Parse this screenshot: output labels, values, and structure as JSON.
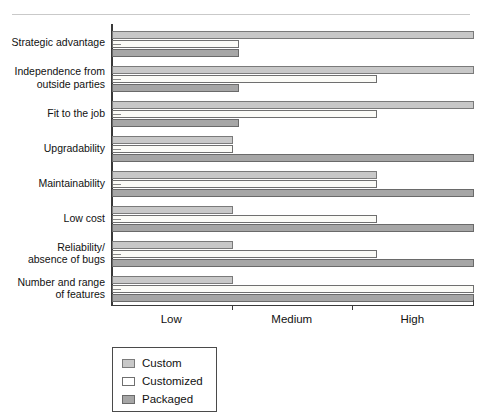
{
  "chart_data": {
    "type": "bar",
    "orientation": "horizontal",
    "title": "",
    "xlabel": "",
    "ylabel": "",
    "grid": false,
    "legend_position": "below-left",
    "axis_ticks": [
      "Low",
      "Medium",
      "High"
    ],
    "axis_scale": "ordinal",
    "axis_range": [
      0,
      3
    ],
    "categories": [
      "Strategic advantage",
      "Independence from\noutside parties",
      "Fit to the job",
      "Upgradability",
      "Maintainability",
      "Low cost",
      "Reliability/\nabsence of bugs",
      "Number and range\nof features"
    ],
    "series": [
      {
        "name": "Custom",
        "color": "#c8c8c8",
        "values": [
          3.0,
          3.0,
          3.0,
          1.0,
          2.2,
          1.0,
          1.0,
          1.0
        ]
      },
      {
        "name": "Customized",
        "color": "#ffffff",
        "values": [
          1.05,
          2.2,
          2.2,
          1.0,
          2.2,
          2.2,
          2.2,
          3.0
        ]
      },
      {
        "name": "Packaged",
        "color": "#a6a6a6",
        "values": [
          1.05,
          1.05,
          1.05,
          3.0,
          3.0,
          3.0,
          3.0,
          3.0
        ]
      }
    ]
  },
  "legend": {
    "items": [
      {
        "label": "Custom"
      },
      {
        "label": "Customized"
      },
      {
        "label": "Packaged"
      }
    ]
  }
}
